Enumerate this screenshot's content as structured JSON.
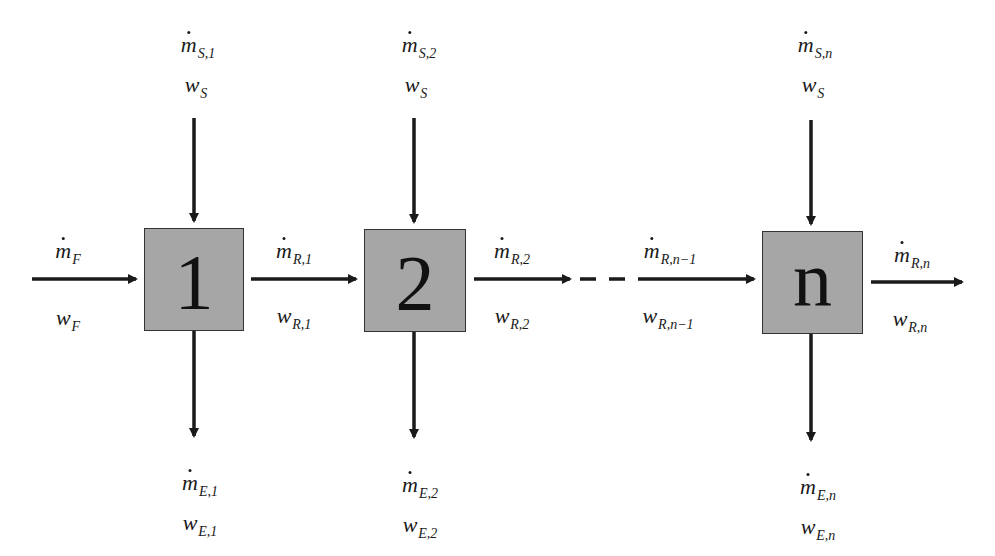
{
  "diagram": {
    "type": "multistage countercurrent/crosscurrent flow schematic",
    "stages": [
      {
        "id": "1",
        "label": "1"
      },
      {
        "id": "2",
        "label": "2"
      },
      {
        "id": "n",
        "label": "n"
      }
    ],
    "feed": {
      "mass_flow": {
        "symbol": "m",
        "sub": "F"
      },
      "fraction": {
        "symbol": "w",
        "sub": "F"
      }
    },
    "solvent_in": [
      {
        "mass_flow": {
          "symbol": "m",
          "sub": "S,1"
        },
        "fraction": {
          "symbol": "w",
          "sub": "S"
        }
      },
      {
        "mass_flow": {
          "symbol": "m",
          "sub": "S,2"
        },
        "fraction": {
          "symbol": "w",
          "sub": "S"
        }
      },
      {
        "mass_flow": {
          "symbol": "m",
          "sub": "S,n"
        },
        "fraction": {
          "symbol": "w",
          "sub": "S"
        }
      }
    ],
    "raffinate": [
      {
        "mass_flow": {
          "symbol": "m",
          "sub": "R,1"
        },
        "fraction": {
          "symbol": "w",
          "sub": "R,1"
        }
      },
      {
        "mass_flow": {
          "symbol": "m",
          "sub": "R,2"
        },
        "fraction": {
          "symbol": "w",
          "sub": "R,2"
        }
      },
      {
        "mass_flow": {
          "symbol": "m",
          "sub": "R,n−1"
        },
        "fraction": {
          "symbol": "w",
          "sub": "R,n−1"
        }
      },
      {
        "mass_flow": {
          "symbol": "m",
          "sub": "R,n"
        },
        "fraction": {
          "symbol": "w",
          "sub": "R,n"
        }
      }
    ],
    "extract": [
      {
        "mass_flow": {
          "symbol": "m",
          "sub": "E,1"
        },
        "fraction": {
          "symbol": "w",
          "sub": "E,1"
        }
      },
      {
        "mass_flow": {
          "symbol": "m",
          "sub": "E,2"
        },
        "fraction": {
          "symbol": "w",
          "sub": "E,2"
        }
      },
      {
        "mass_flow": {
          "symbol": "m",
          "sub": "E,n"
        },
        "fraction": {
          "symbol": "w",
          "sub": "E,n"
        }
      }
    ],
    "colors": {
      "box_fill": "#a6a6a6",
      "box_border": "#333333",
      "arrow": "#1a1a1a"
    }
  }
}
